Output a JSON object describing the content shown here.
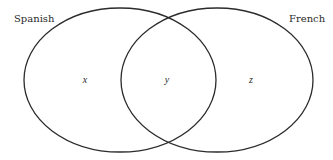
{
  "diagram": {
    "type": "venn",
    "stroke_color": "#2b2b2b",
    "sets": [
      {
        "id": "left",
        "label": "Spanish",
        "cx": 120,
        "cy": 80,
        "rx": 96,
        "ry": 72
      },
      {
        "id": "right",
        "label": "French",
        "cx": 217,
        "cy": 80,
        "rx": 96,
        "ry": 72
      }
    ],
    "regions": {
      "left_only": "x",
      "intersection": "y",
      "right_only": "z"
    }
  }
}
